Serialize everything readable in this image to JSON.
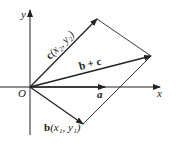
{
  "figure": {
    "axes": {
      "x_label": "x",
      "y_label": "y",
      "origin_label": "O"
    },
    "vectors": [
      {
        "id": "a",
        "label": "a",
        "tip": [
          105,
          87
        ]
      },
      {
        "id": "b",
        "label": "b(x₁, y₁)",
        "tip": [
          83,
          124
        ]
      },
      {
        "id": "c",
        "label": "c(x₂, y₂)",
        "tip": [
          97,
          19
        ]
      },
      {
        "id": "b_plus_c",
        "label": "b + c",
        "tip": [
          151,
          56
        ]
      }
    ],
    "labels": {
      "a": "a",
      "b": "b",
      "b_coords": "(x₁, y₁)",
      "c": "c",
      "c_coords": "(x₂, y₂)",
      "sum": "b + c"
    },
    "colors": {
      "line": "#222222",
      "background": "#ffffff"
    }
  }
}
